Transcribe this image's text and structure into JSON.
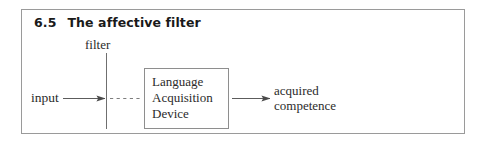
{
  "figure": {
    "number": "6.5",
    "title": "The affective filter",
    "caption_full": "6.5   The affective filter"
  },
  "diagram": {
    "type": "flow-diagram",
    "nodes": [
      {
        "id": "input",
        "label": "input",
        "kind": "text-label"
      },
      {
        "id": "filter",
        "label": "filter",
        "kind": "barrier-label"
      },
      {
        "id": "lad",
        "label_lines": [
          "Language",
          "Acquisition",
          "Device"
        ],
        "kind": "box"
      },
      {
        "id": "outcome",
        "label_lines": [
          "acquired",
          "competence"
        ],
        "kind": "text-label"
      }
    ],
    "edges": [
      {
        "from": "input",
        "to": "filter",
        "style": "solid",
        "arrowhead": true
      },
      {
        "from": "filter",
        "to": "lad",
        "style": "dashed",
        "arrowhead": false
      },
      {
        "from": "lad",
        "to": "outcome",
        "style": "solid",
        "arrowhead": true
      }
    ]
  },
  "colors": {
    "frame_border": "#9a9a9a",
    "box_border": "#8e8e8e",
    "line": "#6f6f6f",
    "heading_text": "#1a1a1a",
    "body_text": "#2b2b2b",
    "background": "#ffffff"
  }
}
